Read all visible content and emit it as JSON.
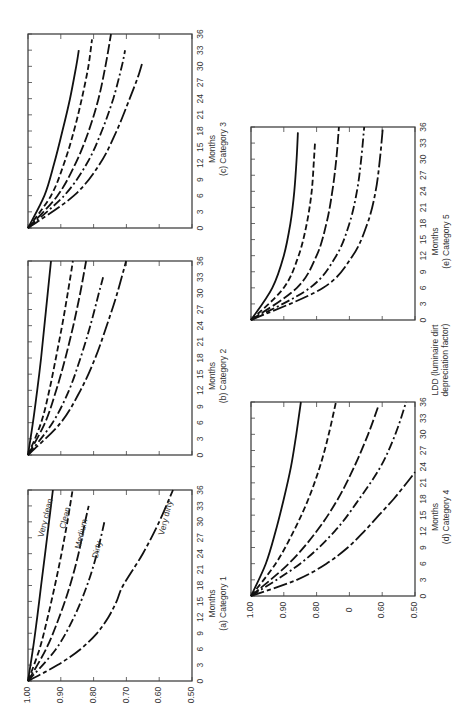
{
  "figure": {
    "shared_ylabel": "LDD (luminaire dirt depreciation factor)",
    "xlabel": "Months",
    "line_styles": {
      "Very clean": "solid",
      "Clean": "short-dash",
      "Medium": "long-dash",
      "Dirty": "dash-dot",
      "Very dirty": "long-dash-short"
    }
  },
  "chart_data": [
    {
      "id": "a",
      "type": "line",
      "title": "(a)  Category 1",
      "xlabel": "Months",
      "ylabel": "LDD",
      "xlim": [
        0,
        36
      ],
      "ylim": [
        0.5,
        1.0
      ],
      "x_ticks": [
        "0",
        "3",
        "6",
        "9",
        "12",
        "15",
        "18",
        "21",
        "24",
        "27",
        "30",
        "33",
        "36"
      ],
      "y_ticks": [
        "1.00",
        "0.90",
        "0.80",
        "0.70",
        "0.60",
        "0.50"
      ],
      "show_y_labels": true,
      "curve_labels": true,
      "series": [
        {
          "name": "Very clean",
          "x": [
            0,
            6,
            12,
            18,
            24,
            30,
            36
          ],
          "values": [
            1.0,
            0.985,
            0.972,
            0.96,
            0.948,
            0.936,
            0.924
          ]
        },
        {
          "name": "Clean",
          "x": [
            0,
            6,
            12,
            18,
            24,
            30,
            36
          ],
          "values": [
            1.0,
            0.965,
            0.94,
            0.918,
            0.898,
            0.88,
            0.864
          ]
        },
        {
          "name": "Medium",
          "x": [
            0,
            6,
            12,
            18,
            24,
            30,
            33
          ],
          "values": [
            1.0,
            0.945,
            0.905,
            0.872,
            0.846,
            0.826,
            0.815
          ]
        },
        {
          "name": "Dirty",
          "x": [
            0,
            6,
            12,
            18,
            24,
            30
          ],
          "values": [
            1.0,
            0.915,
            0.86,
            0.82,
            0.79,
            0.767
          ]
        },
        {
          "name": "Very dirty",
          "x": [
            0,
            3,
            6,
            9,
            12,
            15,
            18,
            24,
            30,
            36
          ],
          "values": [
            1.0,
            0.91,
            0.84,
            0.79,
            0.755,
            0.73,
            0.71,
            0.65,
            0.6,
            0.558
          ]
        }
      ]
    },
    {
      "id": "b",
      "type": "line",
      "title": "(b)  Category 2",
      "xlabel": "Months",
      "xlim": [
        0,
        36
      ],
      "ylim": [
        0.5,
        1.0
      ],
      "x_ticks": [
        "0",
        "3",
        "6",
        "9",
        "12",
        "15",
        "18",
        "21",
        "24",
        "27",
        "30",
        "33",
        "36"
      ],
      "show_y_labels": false,
      "series": [
        {
          "name": "Very clean",
          "x": [
            0,
            6,
            12,
            18,
            24,
            30,
            36
          ],
          "values": [
            1.0,
            0.985,
            0.972,
            0.96,
            0.95,
            0.94,
            0.93
          ]
        },
        {
          "name": "Clean",
          "x": [
            0,
            6,
            12,
            18,
            24,
            30,
            36
          ],
          "values": [
            1.0,
            0.96,
            0.935,
            0.915,
            0.896,
            0.879,
            0.863
          ]
        },
        {
          "name": "Medium",
          "x": [
            0,
            6,
            12,
            18,
            24,
            30,
            36
          ],
          "values": [
            1.0,
            0.948,
            0.914,
            0.886,
            0.862,
            0.841,
            0.823
          ]
        },
        {
          "name": "Dirty",
          "x": [
            0,
            6,
            12,
            18,
            24,
            30,
            33
          ],
          "values": [
            1.0,
            0.925,
            0.875,
            0.84,
            0.81,
            0.784,
            0.771
          ]
        },
        {
          "name": "Very dirty",
          "x": [
            0,
            6,
            12,
            18,
            24,
            30,
            36
          ],
          "values": [
            1.0,
            0.9,
            0.84,
            0.795,
            0.76,
            0.728,
            0.701
          ]
        }
      ]
    },
    {
      "id": "c",
      "type": "line",
      "title": "(c)  Category 3",
      "xlabel": "Months",
      "xlim": [
        0,
        36
      ],
      "ylim": [
        0.5,
        1.0
      ],
      "x_ticks": [
        "0",
        "3",
        "6",
        "9",
        "12",
        "15",
        "18",
        "21",
        "24",
        "27",
        "30",
        "33",
        "36"
      ],
      "show_y_labels": false,
      "series": [
        {
          "name": "Very clean",
          "x": [
            0,
            6,
            12,
            18,
            24,
            30,
            33
          ],
          "values": [
            1.0,
            0.95,
            0.92,
            0.895,
            0.872,
            0.853,
            0.845
          ]
        },
        {
          "name": "Clean",
          "x": [
            0,
            6,
            12,
            18,
            24,
            30,
            35
          ],
          "values": [
            1.0,
            0.93,
            0.89,
            0.86,
            0.836,
            0.816,
            0.805
          ]
        },
        {
          "name": "Medium",
          "x": [
            0,
            6,
            12,
            18,
            24,
            30,
            36
          ],
          "values": [
            1.0,
            0.91,
            0.855,
            0.815,
            0.785,
            0.764,
            0.747
          ]
        },
        {
          "name": "Dirty",
          "x": [
            0,
            6,
            12,
            18,
            24,
            30,
            33
          ],
          "values": [
            1.0,
            0.89,
            0.82,
            0.775,
            0.74,
            0.714,
            0.704
          ]
        },
        {
          "name": "Very dirty",
          "x": [
            0,
            6,
            12,
            18,
            24,
            28,
            31
          ],
          "values": [
            1.0,
            0.86,
            0.78,
            0.73,
            0.69,
            0.665,
            0.65
          ]
        }
      ]
    },
    {
      "id": "d",
      "type": "line",
      "title": "(d)  Category 4",
      "xlabel": "Months",
      "ylabel": "LDD",
      "xlim": [
        0,
        36
      ],
      "ylim": [
        0.5,
        1.0
      ],
      "x_ticks": [
        "0",
        "3",
        "6",
        "9",
        "12",
        "15",
        "18",
        "21",
        "24",
        "27",
        "30",
        "33",
        "36"
      ],
      "y_ticks": [
        "1.00",
        "0.90",
        "0.80",
        "0",
        "0.60",
        "0.50"
      ],
      "show_y_labels": true,
      "series": [
        {
          "name": "Very clean",
          "x": [
            0,
            6,
            12,
            18,
            24,
            30,
            36
          ],
          "values": [
            1.0,
            0.955,
            0.925,
            0.9,
            0.878,
            0.862,
            0.848
          ]
        },
        {
          "name": "Clean",
          "x": [
            0,
            6,
            12,
            18,
            24,
            30,
            36
          ],
          "values": [
            1.0,
            0.925,
            0.87,
            0.825,
            0.79,
            0.763,
            0.741
          ]
        },
        {
          "name": "Medium",
          "x": [
            0,
            6,
            12,
            18,
            24,
            30,
            35
          ],
          "values": [
            1.0,
            0.885,
            0.8,
            0.735,
            0.685,
            0.643,
            0.613
          ]
        },
        {
          "name": "Dirty",
          "x": [
            0,
            6,
            12,
            18,
            24,
            30,
            36
          ],
          "values": [
            1.0,
            0.85,
            0.745,
            0.67,
            0.605,
            0.56,
            0.527
          ]
        },
        {
          "name": "Very dirty",
          "x": [
            0,
            3,
            6,
            9,
            12,
            15,
            18,
            21,
            23
          ],
          "values": [
            1.0,
            0.86,
            0.77,
            0.705,
            0.655,
            0.61,
            0.565,
            0.525,
            0.5
          ]
        }
      ]
    },
    {
      "id": "e",
      "type": "line",
      "title": "(e)  Category 5",
      "xlabel": "Months",
      "xlim": [
        0,
        36
      ],
      "ylim": [
        0.5,
        1.0
      ],
      "x_ticks": [
        "0",
        "3",
        "6",
        "9",
        "12",
        "15",
        "18",
        "21",
        "24",
        "27",
        "30",
        "33",
        "36"
      ],
      "show_y_labels": false,
      "series": [
        {
          "name": "Very clean",
          "x": [
            0,
            6,
            12,
            18,
            24,
            30,
            35
          ],
          "values": [
            1.0,
            0.935,
            0.9,
            0.88,
            0.868,
            0.861,
            0.857
          ]
        },
        {
          "name": "Clean",
          "x": [
            0,
            6,
            12,
            18,
            24,
            30,
            33
          ],
          "values": [
            1.0,
            0.9,
            0.855,
            0.83,
            0.815,
            0.808,
            0.805
          ]
        },
        {
          "name": "Medium",
          "x": [
            0,
            6,
            12,
            18,
            24,
            30,
            36
          ],
          "values": [
            1.0,
            0.86,
            0.8,
            0.77,
            0.752,
            0.74,
            0.732
          ]
        },
        {
          "name": "Dirty",
          "x": [
            0,
            6,
            12,
            18,
            24,
            30,
            36
          ],
          "values": [
            1.0,
            0.82,
            0.74,
            0.7,
            0.677,
            0.664,
            0.655
          ]
        },
        {
          "name": "Very dirty",
          "x": [
            0,
            6,
            12,
            18,
            24,
            30,
            36
          ],
          "values": [
            1.0,
            0.78,
            0.69,
            0.645,
            0.62,
            0.607,
            0.598
          ]
        }
      ]
    }
  ],
  "layout": {
    "a": {
      "left": 28,
      "top": 490,
      "width": 164,
      "height": 191
    },
    "b": {
      "left": 28,
      "top": 261,
      "width": 164,
      "height": 194
    },
    "c": {
      "left": 28,
      "top": 34,
      "width": 164,
      "height": 194
    },
    "d": {
      "left": 251,
      "top": 402,
      "width": 164,
      "height": 194
    },
    "e": {
      "left": 251,
      "top": 127,
      "width": 164,
      "height": 193
    }
  }
}
